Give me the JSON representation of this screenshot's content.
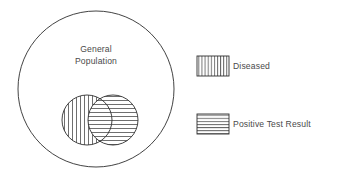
{
  "diagram": {
    "type": "venn",
    "title": "",
    "universe": {
      "name": "general-population",
      "label_line1": "General",
      "label_line2": "Population",
      "shape": "circle",
      "cx": 96,
      "cy": 89,
      "r": 78,
      "fill": "#ffffff",
      "stroke": "#2e2e2e"
    },
    "sets": [
      {
        "id": "diseased",
        "label": "Diseased",
        "shape": "circle",
        "cx": 87,
        "cy": 120,
        "r": 25,
        "hatch": "vertical",
        "stroke": "#2e2e2e",
        "hatch_color": "#555555"
      },
      {
        "id": "positive-test-result",
        "label": "Positive Test Result",
        "shape": "circle",
        "cx": 113,
        "cy": 120,
        "r": 25,
        "hatch": "horizontal",
        "stroke": "#2e2e2e",
        "hatch_color": "#555555"
      }
    ],
    "intersection": {
      "id": "true-positive",
      "label": "",
      "hatch": "cross"
    }
  },
  "legend": {
    "position": "right",
    "items": [
      {
        "id": "legend-diseased",
        "label": "Diseased",
        "hatch": "vertical",
        "swatch": {
          "x": 197,
          "y": 56,
          "width": 32,
          "height": 20
        },
        "text_x": 233,
        "text_y": 66
      },
      {
        "id": "legend-positive-test-result",
        "label": "Positive Test Result",
        "hatch": "horizontal",
        "swatch": {
          "x": 197,
          "y": 114,
          "width": 32,
          "height": 20
        },
        "text_x": 233,
        "text_y": 124
      }
    ]
  },
  "colors": {
    "background": "#ffffff",
    "outline": "#2e2e2e",
    "hatch": "#555555",
    "text": "#4a4a4a"
  }
}
